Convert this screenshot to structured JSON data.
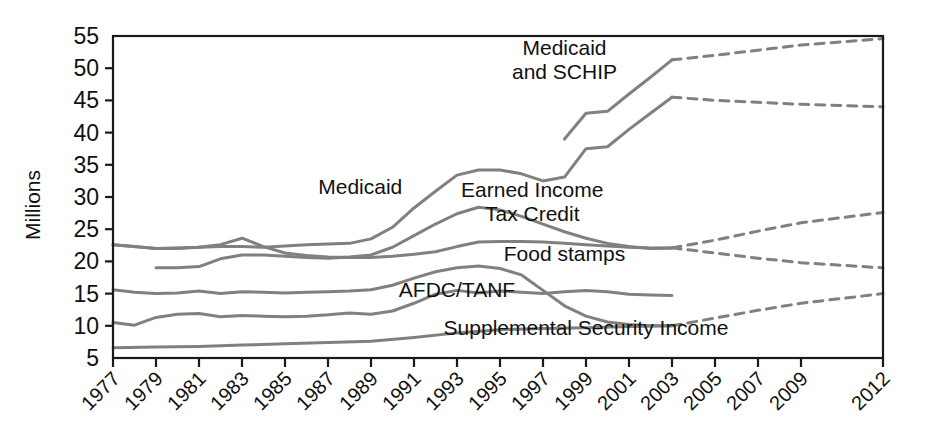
{
  "chart_data": {
    "type": "line",
    "title": "",
    "subtitle": "",
    "xlabel": "",
    "ylabel": "Millions",
    "ylim": [
      5,
      55
    ],
    "ytick_labels": [
      "55",
      "50",
      "45",
      "40",
      "35",
      "30",
      "25",
      "20",
      "15",
      "10",
      "5"
    ],
    "ytick_values": [
      55,
      50,
      45,
      40,
      35,
      30,
      25,
      20,
      15,
      10,
      5
    ],
    "xtick_labels": [
      "1977",
      "1979",
      "1981",
      "1983",
      "1985",
      "1987",
      "1989",
      "1991",
      "1993",
      "1995",
      "1997",
      "1999",
      "2001",
      "2003",
      "2005",
      "2007",
      "2009",
      "2012"
    ],
    "xtick_values": [
      1977,
      1979,
      1981,
      1983,
      1985,
      1987,
      1989,
      1991,
      1993,
      1995,
      1997,
      1999,
      2001,
      2003,
      2005,
      2007,
      2009,
      2012
    ],
    "xlim": [
      1977,
      2012
    ],
    "grid": false,
    "legend_position": "inline-annotations",
    "annotations": [
      {
        "name": "medicaid-and-schip-label",
        "text": "Medicaid\nand SCHIP",
        "lines": [
          "Medicaid",
          "and SCHIP"
        ],
        "x": 1998.0,
        "y": 52.0
      },
      {
        "name": "medicaid-label",
        "text": "Medicaid",
        "lines": [
          "Medicaid"
        ],
        "x": 1988.5,
        "y": 30.5
      },
      {
        "name": "earned-income-tax-credit-label",
        "text": "Earned Income\nTax Credit",
        "lines": [
          "Earned Income",
          "Tax Credit"
        ],
        "x": 1996.5,
        "y": 30.0
      },
      {
        "name": "food-stamps-label",
        "text": "Food stamps",
        "lines": [
          "Food stamps"
        ],
        "x": 1998.0,
        "y": 20.0
      },
      {
        "name": "afdc-tanf-label",
        "text": "AFDC/TANF",
        "lines": [
          "AFDC/TANF"
        ],
        "x": 1993.0,
        "y": 14.5
      },
      {
        "name": "supplemental-security-income-label",
        "text": "Supplemental Security Income",
        "lines": [
          "Supplemental Security Income"
        ],
        "x": 1999.0,
        "y": 8.5
      }
    ],
    "series": [
      {
        "name": "Medicaid and SCHIP",
        "style": "solid",
        "color": "#808080",
        "points": [
          [
            1977,
            22.6
          ],
          [
            1978,
            22.3
          ],
          [
            1979,
            22.0
          ],
          [
            1980,
            22.0
          ],
          [
            1981,
            22.2
          ],
          [
            1982,
            22.3
          ],
          [
            1983,
            22.3
          ],
          [
            1984,
            22.2
          ],
          [
            1985,
            22.4
          ],
          [
            1986,
            22.6
          ],
          [
            1987,
            22.7
          ],
          [
            1988,
            22.8
          ],
          [
            1989,
            23.5
          ],
          [
            1990,
            25.3
          ],
          [
            1991,
            28.3
          ],
          [
            1992,
            30.9
          ],
          [
            1993,
            33.4
          ],
          [
            1994,
            34.2
          ],
          [
            1995,
            34.2
          ],
          [
            1996,
            33.6
          ],
          [
            1997,
            32.5
          ],
          [
            1998,
            33.1
          ],
          [
            1999,
            37.5
          ],
          [
            2000,
            37.8
          ],
          [
            2001,
            40.5
          ],
          [
            2002,
            43.0
          ],
          [
            2003,
            45.5
          ]
        ]
      },
      {
        "name": "Medicaid and SCHIP (projected)",
        "style": "dashed",
        "color": "#808080",
        "points": [
          [
            2003,
            45.5
          ],
          [
            2005,
            45.0
          ],
          [
            2007,
            44.7
          ],
          [
            2009,
            44.4
          ],
          [
            2012,
            44.0
          ]
        ]
      },
      {
        "name": "Medicaid and SCHIP upper",
        "style": "solid",
        "color": "#808080",
        "points": [
          [
            1998,
            39.0
          ],
          [
            1999,
            43.0
          ],
          [
            2000,
            43.3
          ],
          [
            2001,
            46.0
          ],
          [
            2002,
            48.6
          ],
          [
            2003,
            51.3
          ]
        ]
      },
      {
        "name": "Medicaid and SCHIP upper (projected)",
        "style": "dashed",
        "color": "#808080",
        "points": [
          [
            2003,
            51.3
          ],
          [
            2005,
            52.0
          ],
          [
            2007,
            52.8
          ],
          [
            2009,
            53.6
          ],
          [
            2012,
            54.6
          ]
        ]
      },
      {
        "name": "Earned Income Tax Credit",
        "style": "solid",
        "color": "#9a9a9a",
        "points": [
          [
            1979,
            19.0
          ],
          [
            1980,
            19.0
          ],
          [
            1981,
            19.2
          ],
          [
            1982,
            20.4
          ],
          [
            1983,
            21.0
          ],
          [
            1984,
            21.0
          ],
          [
            1985,
            20.8
          ],
          [
            1986,
            20.6
          ],
          [
            1987,
            20.5
          ],
          [
            1988,
            20.7
          ],
          [
            1989,
            21.0
          ],
          [
            1990,
            22.2
          ],
          [
            1991,
            24.0
          ],
          [
            1992,
            25.8
          ],
          [
            1993,
            27.4
          ],
          [
            1994,
            28.4
          ],
          [
            1995,
            28.0
          ],
          [
            1996,
            27.0
          ],
          [
            1997,
            25.8
          ],
          [
            1998,
            24.6
          ],
          [
            1999,
            23.6
          ],
          [
            2000,
            22.8
          ],
          [
            2001,
            22.3
          ],
          [
            2002,
            22.0
          ],
          [
            2003,
            22.1
          ]
        ]
      },
      {
        "name": "Earned Income Tax Credit (projected)",
        "style": "dashed",
        "color": "#9a9a9a",
        "points": [
          [
            2003,
            22.1
          ],
          [
            2005,
            23.3
          ],
          [
            2007,
            24.7
          ],
          [
            2009,
            26.0
          ],
          [
            2012,
            27.6
          ]
        ]
      },
      {
        "name": "Food stamps",
        "style": "solid",
        "color": "#8a8a8a",
        "points": [
          [
            1977,
            10.5
          ],
          [
            1978,
            10.1
          ],
          [
            1979,
            11.3
          ],
          [
            1980,
            11.8
          ],
          [
            1981,
            11.9
          ],
          [
            1982,
            11.4
          ],
          [
            1983,
            11.6
          ],
          [
            1984,
            11.5
          ],
          [
            1985,
            11.4
          ],
          [
            1986,
            11.5
          ],
          [
            1987,
            11.7
          ],
          [
            1988,
            12.0
          ],
          [
            1989,
            11.8
          ],
          [
            1990,
            12.3
          ],
          [
            1991,
            13.5
          ],
          [
            1992,
            14.9
          ],
          [
            1993,
            15.5
          ],
          [
            1994,
            15.1
          ],
          [
            1995,
            15.4
          ],
          [
            1996,
            15.2
          ],
          [
            1997,
            15.0
          ],
          [
            1998,
            15.3
          ],
          [
            1999,
            15.5
          ],
          [
            2000,
            15.3
          ],
          [
            2001,
            14.9
          ],
          [
            2002,
            14.8
          ],
          [
            2003,
            14.7
          ]
        ]
      },
      {
        "name": "Food stamps upper",
        "style": "solid",
        "color": "#8a8a8a",
        "points": [
          [
            1977,
            22.6
          ],
          [
            1979,
            22.0
          ],
          [
            1981,
            22.2
          ],
          [
            1982,
            22.6
          ],
          [
            1983,
            23.6
          ],
          [
            1984,
            22.3
          ],
          [
            1985,
            21.3
          ],
          [
            1986,
            20.9
          ],
          [
            1987,
            20.7
          ],
          [
            1988,
            20.6
          ],
          [
            1989,
            20.6
          ],
          [
            1990,
            20.8
          ],
          [
            1991,
            21.1
          ],
          [
            1992,
            21.5
          ],
          [
            1993,
            22.3
          ],
          [
            1994,
            23.0
          ],
          [
            1995,
            23.1
          ],
          [
            1996,
            23.1
          ],
          [
            1997,
            23.0
          ],
          [
            1998,
            22.8
          ],
          [
            1999,
            22.6
          ],
          [
            2000,
            22.4
          ],
          [
            2001,
            22.2
          ],
          [
            2002,
            22.1
          ],
          [
            2003,
            22.1
          ]
        ]
      },
      {
        "name": "Food stamps (projected)",
        "style": "dashed",
        "color": "#8a8a8a",
        "points": [
          [
            2003,
            22.1
          ],
          [
            2005,
            21.3
          ],
          [
            2007,
            20.5
          ],
          [
            2009,
            19.8
          ],
          [
            2012,
            19.0
          ]
        ]
      },
      {
        "name": "AFDC/TANF",
        "style": "solid",
        "color": "#808080",
        "points": [
          [
            1977,
            15.6
          ],
          [
            1978,
            15.2
          ],
          [
            1979,
            15.0
          ],
          [
            1980,
            15.1
          ],
          [
            1981,
            15.4
          ],
          [
            1982,
            15.0
          ],
          [
            1983,
            15.3
          ],
          [
            1984,
            15.2
          ],
          [
            1985,
            15.1
          ],
          [
            1986,
            15.2
          ],
          [
            1987,
            15.3
          ],
          [
            1988,
            15.4
          ],
          [
            1989,
            15.6
          ],
          [
            1990,
            16.3
          ],
          [
            1991,
            17.4
          ],
          [
            1992,
            18.4
          ],
          [
            1993,
            19.0
          ],
          [
            1994,
            19.3
          ],
          [
            1995,
            18.9
          ],
          [
            1996,
            17.9
          ],
          [
            1997,
            15.5
          ],
          [
            1998,
            13.1
          ],
          [
            1999,
            11.5
          ],
          [
            2000,
            10.6
          ],
          [
            2001,
            10.2
          ],
          [
            2002,
            10.0
          ],
          [
            2003,
            10.0
          ]
        ]
      },
      {
        "name": "Supplemental Security Income",
        "style": "solid",
        "color": "#9a9a9a",
        "points": [
          [
            1977,
            6.6
          ],
          [
            1979,
            6.7
          ],
          [
            1981,
            6.8
          ],
          [
            1983,
            7.0
          ],
          [
            1985,
            7.2
          ],
          [
            1987,
            7.4
          ],
          [
            1989,
            7.6
          ],
          [
            1991,
            8.2
          ],
          [
            1993,
            8.9
          ],
          [
            1995,
            9.4
          ],
          [
            1997,
            9.6
          ],
          [
            1999,
            9.7
          ],
          [
            2001,
            9.9
          ],
          [
            2003,
            10.0
          ]
        ]
      },
      {
        "name": "Supplemental Security Income (projected)",
        "style": "dashed",
        "color": "#9a9a9a",
        "points": [
          [
            2003,
            10.0
          ],
          [
            2005,
            11.2
          ],
          [
            2007,
            12.4
          ],
          [
            2009,
            13.5
          ],
          [
            2012,
            15.0
          ]
        ]
      }
    ]
  }
}
